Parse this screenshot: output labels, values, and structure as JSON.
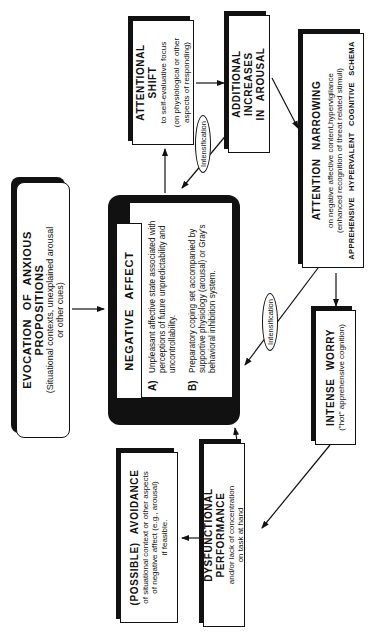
{
  "diagram": {
    "orientation": "rotated 90 degrees counter-clockwise",
    "nodes": {
      "evocation": {
        "title": "EVOCATION OF ANXIOUS PROPOSITIONS",
        "sub1": "(Situational contexts, unexplained arousal",
        "sub2": "or other cues)"
      },
      "negative_affect": {
        "title": "NEGATIVE AFFECT",
        "item_a_label": "A)",
        "item_a_text": "Unpleasant affective state associated with perceptions of future unpredictability and uncontrollability.",
        "item_b_label": "B)",
        "item_b_text": "Preparatory coping set accompanied by supportive physiology (arousal) or Gray's behavioral inhibition system."
      },
      "attentional_shift": {
        "title": "ATTENTIONAL SHIFT",
        "sub1": "to self-evaluative focus",
        "sub2": "(on physiological or other",
        "sub3": "aspects of responding)"
      },
      "additional_increases": {
        "title1": "ADDITIONAL INCREASES",
        "title2": "IN AROUSAL"
      },
      "attention_narrowing": {
        "title": "ATTENTION NARROWING",
        "sub1": "on negative affective content,hypervigilance",
        "sub2": "(enhanced recognition of threat related stimuli)",
        "schema": "APPREHENSIVE HYPERVALENT COGNITIVE SCHEMA"
      },
      "intense_worry": {
        "title": "INTENSE WORRY",
        "sub1": "(\"hot\" apprehensive cognition)"
      },
      "dysfunctional_performance": {
        "title": "DYSFUNCTIONAL PERFORMANCE",
        "sub1": "and/or lack of concentration",
        "sub2": "on task at hand"
      },
      "avoidance": {
        "title": "(POSSIBLE) AVOIDANCE",
        "sub1": "of situational context or other aspects",
        "sub2": "of negative affect (e.g., arousal)",
        "sub3": "if feasible."
      }
    },
    "edge_labels": {
      "intensification_1": "Intensification",
      "intensification_2": "Intensification"
    },
    "colors": {
      "ink": "#111111",
      "paper": "#ffffff"
    }
  }
}
